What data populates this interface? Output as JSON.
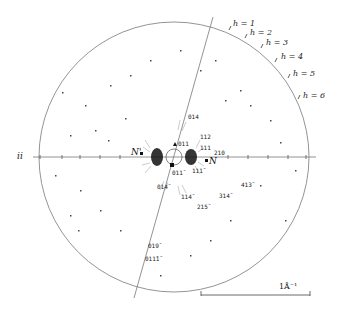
{
  "figure": {
    "type": "reciprocal-space diffraction pattern",
    "axis_label": "ii",
    "layer_lines": [
      {
        "label": "h = 1",
        "x": 233,
        "y": 20
      },
      {
        "label": "h = 2",
        "x": 250,
        "y": 29
      },
      {
        "label": "h = 3",
        "x": 266,
        "y": 39
      },
      {
        "label": "h = 4",
        "x": 281,
        "y": 53
      },
      {
        "label": "h = 5",
        "x": 293,
        "y": 70
      },
      {
        "label": "h = 6",
        "x": 303,
        "y": 92
      }
    ],
    "reflections": [
      {
        "label": "014",
        "x": 188,
        "y": 114
      },
      {
        "label": "112",
        "x": 200,
        "y": 134
      },
      {
        "label": "011",
        "x": 178,
        "y": 141
      },
      {
        "label": "111",
        "x": 200,
        "y": 144
      },
      {
        "label": "210",
        "x": 214,
        "y": 150
      },
      {
        "label": "011̄",
        "x": 172,
        "y": 170
      },
      {
        "label": "111̄",
        "x": 192,
        "y": 168
      },
      {
        "label": "014̄",
        "x": 157,
        "y": 184
      },
      {
        "label": "114̄",
        "x": 181,
        "y": 194
      },
      {
        "label": "215̄",
        "x": 197,
        "y": 204
      },
      {
        "label": "314̄",
        "x": 219,
        "y": 193
      },
      {
        "label": "413̄",
        "x": 241,
        "y": 182
      },
      {
        "label": "019̄",
        "x": 148,
        "y": 243
      },
      {
        "label": "011̄1̄",
        "x": 145,
        "y": 256
      }
    ],
    "poles": [
      {
        "label": "N'",
        "x": 131,
        "y": 150
      },
      {
        "label": "N",
        "x": 209,
        "y": 158
      }
    ],
    "scale_bar": {
      "label": "1Å⁻¹"
    },
    "colors": {
      "line": "#777777",
      "ink": "#111111",
      "spot": "#333333"
    }
  }
}
